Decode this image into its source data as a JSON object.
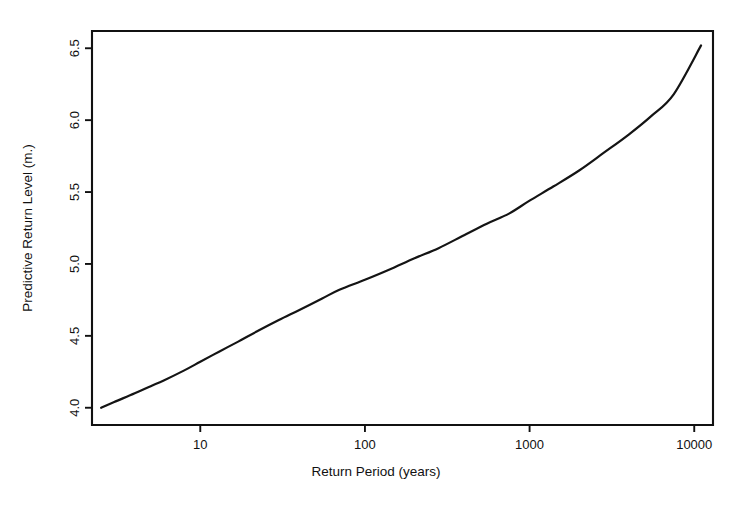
{
  "chart_data": {
    "type": "line",
    "title": "",
    "xlabel": "Return Period (years)",
    "ylabel": "Predictive Return Level (m.)",
    "xscale": "log",
    "yscale": "linear",
    "grid": false,
    "legend": null,
    "xlim": [
      2.2,
      13000
    ],
    "ylim": [
      3.88,
      6.62
    ],
    "xticks": [
      10,
      100,
      1000,
      10000
    ],
    "xtick_labels": [
      "10",
      "100",
      "1000",
      "10000"
    ],
    "yticks": [
      4.0,
      4.5,
      5.0,
      5.5,
      6.0,
      6.5
    ],
    "ytick_labels": [
      "4.0",
      "4.5",
      "5.0",
      "5.5",
      "6.0",
      "6.5"
    ],
    "series": [
      {
        "name": "Predictive return level",
        "color": "#141414",
        "x": [
          2.5,
          3,
          4,
          5,
          6,
          8,
          10,
          13,
          17,
          22,
          30,
          40,
          55,
          70,
          100,
          140,
          200,
          280,
          400,
          550,
          750,
          1000,
          1400,
          2000,
          2800,
          4000,
          5500,
          7500,
          11000
        ],
        "y": [
          4.0,
          4.04,
          4.1,
          4.15,
          4.19,
          4.26,
          4.32,
          4.39,
          4.46,
          4.53,
          4.61,
          4.68,
          4.76,
          4.82,
          4.89,
          4.96,
          5.04,
          5.11,
          5.2,
          5.28,
          5.35,
          5.44,
          5.54,
          5.65,
          5.77,
          5.9,
          6.03,
          6.18,
          6.52
        ]
      }
    ]
  },
  "axes_geometry": {
    "plot_left_px": 92,
    "plot_right_px": 713,
    "plot_top_px": 31,
    "plot_bottom_px": 425
  }
}
